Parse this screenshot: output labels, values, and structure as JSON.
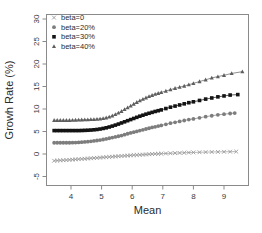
{
  "chart_data": {
    "type": "scatter",
    "title": "",
    "xlabel": "Mean",
    "ylabel": "Growh Rate (%)",
    "xlim": [
      3.2,
      9.8
    ],
    "ylim": [
      -7.0,
      31.0
    ],
    "xticks": [
      4,
      5,
      6,
      7,
      8,
      9
    ],
    "yticks": [
      -5,
      0,
      5,
      10,
      15,
      20,
      25,
      30
    ],
    "grid": false,
    "legend_position": "top-left",
    "series": [
      {
        "name": "beta=0",
        "marker": "x",
        "color": "#9a9a9a",
        "x": [
          3.45,
          3.55,
          3.65,
          3.75,
          3.85,
          3.95,
          4.05,
          4.15,
          4.25,
          4.35,
          4.45,
          4.55,
          4.65,
          4.75,
          4.85,
          4.95,
          5.05,
          5.15,
          5.25,
          5.35,
          5.45,
          5.55,
          5.65,
          5.75,
          5.85,
          5.95,
          6.05,
          6.15,
          6.25,
          6.35,
          6.45,
          6.55,
          6.65,
          6.75,
          6.85,
          6.95,
          7.1,
          7.25,
          7.4,
          7.55,
          7.7,
          7.85,
          8.0,
          8.2,
          8.4,
          8.6,
          8.8,
          9.0,
          9.2,
          9.4
        ],
        "y": [
          -1.5,
          -1.45,
          -1.42,
          -1.38,
          -1.35,
          -1.3,
          -1.25,
          -1.2,
          -1.15,
          -1.1,
          -1.05,
          -1.0,
          -0.95,
          -0.9,
          -0.85,
          -0.8,
          -0.75,
          -0.7,
          -0.65,
          -0.6,
          -0.55,
          -0.5,
          -0.45,
          -0.4,
          -0.35,
          -0.3,
          -0.25,
          -0.22,
          -0.18,
          -0.14,
          -0.1,
          -0.06,
          -0.02,
          0.02,
          0.05,
          0.08,
          0.12,
          0.16,
          0.2,
          0.24,
          0.28,
          0.32,
          0.35,
          0.39,
          0.42,
          0.45,
          0.47,
          0.49,
          0.51,
          0.53
        ]
      },
      {
        "name": "beta=20%",
        "marker": "circle",
        "color": "#7d7d7d",
        "x": [
          3.45,
          3.55,
          3.65,
          3.75,
          3.85,
          3.95,
          4.05,
          4.15,
          4.25,
          4.35,
          4.45,
          4.55,
          4.65,
          4.75,
          4.85,
          4.95,
          5.05,
          5.15,
          5.25,
          5.35,
          5.45,
          5.55,
          5.65,
          5.75,
          5.85,
          5.95,
          6.05,
          6.15,
          6.25,
          6.35,
          6.45,
          6.55,
          6.65,
          6.75,
          6.85,
          6.95,
          7.1,
          7.25,
          7.4,
          7.55,
          7.7,
          7.85,
          8.0,
          8.2,
          8.4,
          8.6,
          8.8,
          9.0,
          9.2,
          9.35
        ],
        "y": [
          2.5,
          2.5,
          2.5,
          2.5,
          2.5,
          2.5,
          2.52,
          2.55,
          2.58,
          2.62,
          2.68,
          2.75,
          2.82,
          2.9,
          3.0,
          3.1,
          3.22,
          3.35,
          3.5,
          3.65,
          3.8,
          3.95,
          4.1,
          4.3,
          4.5,
          4.68,
          4.85,
          5.02,
          5.2,
          5.38,
          5.55,
          5.72,
          5.9,
          6.05,
          6.2,
          6.35,
          6.6,
          6.85,
          7.05,
          7.25,
          7.45,
          7.65,
          7.8,
          8.05,
          8.3,
          8.5,
          8.7,
          8.85,
          9.0,
          9.1
        ]
      },
      {
        "name": "beta=30%",
        "marker": "square",
        "color": "#141414",
        "x": [
          3.45,
          3.55,
          3.65,
          3.75,
          3.85,
          3.95,
          4.05,
          4.15,
          4.25,
          4.35,
          4.45,
          4.55,
          4.65,
          4.75,
          4.85,
          4.95,
          5.05,
          5.15,
          5.25,
          5.35,
          5.45,
          5.55,
          5.65,
          5.75,
          5.85,
          5.95,
          6.05,
          6.15,
          6.25,
          6.35,
          6.45,
          6.55,
          6.65,
          6.75,
          6.85,
          6.95,
          7.1,
          7.25,
          7.4,
          7.55,
          7.7,
          7.85,
          8.0,
          8.2,
          8.4,
          8.6,
          8.8,
          9.0,
          9.2,
          9.45
        ],
        "y": [
          5.2,
          5.2,
          5.2,
          5.2,
          5.2,
          5.2,
          5.2,
          5.2,
          5.2,
          5.22,
          5.25,
          5.28,
          5.32,
          5.38,
          5.45,
          5.55,
          5.68,
          5.82,
          6.0,
          6.2,
          6.42,
          6.65,
          6.9,
          7.15,
          7.4,
          7.65,
          7.9,
          8.15,
          8.4,
          8.62,
          8.85,
          9.05,
          9.25,
          9.45,
          9.62,
          9.8,
          10.1,
          10.4,
          10.65,
          10.9,
          11.15,
          11.4,
          11.6,
          11.9,
          12.2,
          12.45,
          12.7,
          12.9,
          13.1,
          13.2
        ]
      },
      {
        "name": "beta=40%",
        "marker": "triangle",
        "color": "#5e5e5e",
        "x": [
          3.45,
          3.55,
          3.65,
          3.75,
          3.85,
          3.95,
          4.05,
          4.15,
          4.25,
          4.35,
          4.45,
          4.55,
          4.65,
          4.75,
          4.85,
          4.95,
          5.05,
          5.15,
          5.25,
          5.35,
          5.45,
          5.55,
          5.65,
          5.75,
          5.85,
          5.95,
          6.05,
          6.15,
          6.25,
          6.35,
          6.45,
          6.55,
          6.65,
          6.75,
          6.85,
          6.95,
          7.1,
          7.25,
          7.4,
          7.55,
          7.7,
          7.85,
          8.0,
          8.2,
          8.4,
          8.6,
          8.8,
          9.0,
          9.25,
          9.6
        ],
        "y": [
          7.5,
          7.5,
          7.5,
          7.5,
          7.5,
          7.5,
          7.52,
          7.55,
          7.58,
          7.6,
          7.62,
          7.65,
          7.68,
          7.7,
          7.75,
          7.8,
          7.9,
          8.05,
          8.25,
          8.5,
          8.8,
          9.15,
          9.5,
          9.9,
          10.3,
          10.7,
          11.1,
          11.5,
          11.85,
          12.2,
          12.5,
          12.8,
          13.05,
          13.3,
          13.5,
          13.7,
          14.0,
          14.3,
          14.6,
          14.85,
          15.1,
          15.4,
          15.7,
          16.1,
          16.5,
          16.9,
          17.2,
          17.5,
          17.9,
          18.3
        ]
      }
    ]
  }
}
